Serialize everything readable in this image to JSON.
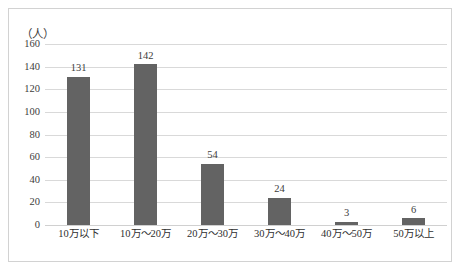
{
  "chart_data": {
    "type": "bar",
    "title": "",
    "subtitle": "",
    "xlabel": "",
    "ylabel": "（人）",
    "ylim": [
      0,
      160
    ],
    "yticks": [
      0,
      20,
      40,
      60,
      80,
      100,
      120,
      140,
      160
    ],
    "grid": true,
    "legend": false,
    "legend_position": "none",
    "bar_color": "#636363",
    "gridline_color": "#d9d9d9",
    "frame_color": "#d2d2d2",
    "text_color": "#3d3d3d",
    "categories": [
      "10万以下",
      "10万～20万",
      "20万～30万",
      "30万～40万",
      "40万～50万",
      "50万以上"
    ],
    "values": [
      131,
      142,
      54,
      24,
      3,
      6
    ],
    "data_labels": [
      "131",
      "142",
      "54",
      "24",
      "3",
      "6"
    ],
    "series": [
      {
        "name": "",
        "values": [
          131,
          142,
          54,
          24,
          3,
          6
        ]
      }
    ]
  },
  "axis": {
    "y_title": "（人）",
    "y_tick_labels": [
      "160",
      "140",
      "120",
      "100",
      "80",
      "60",
      "40",
      "20",
      "0"
    ]
  }
}
